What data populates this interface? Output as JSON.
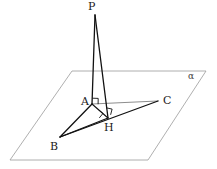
{
  "figure": {
    "background_color": "#ffffff",
    "width": 217,
    "height": 169
  },
  "plane": {
    "name": "alpha",
    "label": "α",
    "stroke_color": "#9a9a9a",
    "stroke_width": 0.8,
    "corners": [
      {
        "x": 72,
        "y": 71
      },
      {
        "x": 206,
        "y": 71
      },
      {
        "x": 148,
        "y": 160
      },
      {
        "x": 10,
        "y": 160
      }
    ],
    "label_position": {
      "x": 188,
      "y": 72
    }
  },
  "points": [
    {
      "id": "P",
      "label": "P",
      "x": 95,
      "y": 15,
      "label_x": 88,
      "label_y": 1
    },
    {
      "id": "A",
      "label": "A",
      "x": 92,
      "y": 104,
      "label_x": 81,
      "label_y": 96
    },
    {
      "id": "B",
      "label": "B",
      "x": 60,
      "y": 137,
      "label_x": 50,
      "label_y": 141
    },
    {
      "id": "C",
      "label": "C",
      "x": 158,
      "y": 101,
      "label_x": 163,
      "label_y": 95
    },
    {
      "id": "H",
      "label": "H",
      "x": 108,
      "y": 118,
      "label_x": 104,
      "label_y": 122
    }
  ],
  "segments": [
    {
      "id": "PA",
      "from": "P",
      "to": "A",
      "style": "solid-dark",
      "stroke": "#111111",
      "width": 1.3
    },
    {
      "id": "PH",
      "from": "P",
      "to": "H",
      "style": "solid-dark",
      "stroke": "#111111",
      "width": 1.3
    },
    {
      "id": "AB",
      "from": "A",
      "to": "B",
      "style": "solid-dark",
      "stroke": "#111111",
      "width": 1.3
    },
    {
      "id": "AH",
      "from": "A",
      "to": "H",
      "style": "solid-dark",
      "stroke": "#111111",
      "width": 1.1
    },
    {
      "id": "BH",
      "from": "B",
      "to": "H",
      "style": "solid-dark",
      "stroke": "#111111",
      "width": 1.3
    },
    {
      "id": "BC",
      "from": "B",
      "to": "C",
      "style": "solid-dark",
      "stroke": "#111111",
      "width": 1.3
    },
    {
      "id": "AC",
      "from": "A",
      "to": "C",
      "style": "solid-light",
      "stroke": "#8d8d8d",
      "width": 1.0
    }
  ],
  "right_angle_marks": [
    {
      "id": "angle-at-A",
      "at": "A",
      "size": 6,
      "note": "right angle at vertex A"
    },
    {
      "id": "angle-at-H-ah-bc",
      "at": "H",
      "size": 6,
      "note": "right angle between AH and BC at H"
    },
    {
      "id": "angle-at-H-ph-bc",
      "at": "H",
      "size": 6,
      "note": "right angle between PH and BC at H"
    }
  ],
  "colors": {
    "line_dark": "#111111",
    "line_light": "#8d8d8d",
    "plane_outline": "#9a9a9a",
    "label_text": "#1a1a1a",
    "plane_label_text": "#3a3a3a"
  }
}
